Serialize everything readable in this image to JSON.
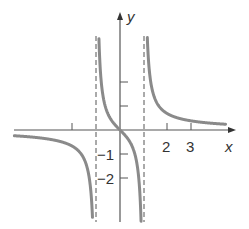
{
  "chart_data": {
    "type": "line",
    "title": "",
    "function": "y = x/(x^2 - 1)",
    "xlabel": "x",
    "ylabel": "y",
    "xlim": [
      -4.5,
      4.5
    ],
    "ylim": [
      -4.2,
      5.2
    ],
    "asymptotes_vertical": [
      -1,
      1
    ],
    "asymptote_horizontal": 0,
    "x_ticks": [
      -2,
      2,
      3
    ],
    "x_tick_labels": [
      "",
      "2",
      "3"
    ],
    "y_ticks": [
      -2,
      -1,
      1,
      2
    ],
    "y_tick_labels": [
      "−2",
      "−1",
      "",
      ""
    ],
    "grid": false,
    "series": [
      {
        "name": "left branch",
        "x": [
          -4.5,
          -3,
          -2,
          -1.5,
          -1.25,
          -1.1
        ],
        "y": [
          -0.23,
          -0.375,
          -0.67,
          -1.2,
          -2.22,
          -5.24
        ]
      },
      {
        "name": "middle branch",
        "x": [
          -0.8,
          -0.5,
          0,
          0.5,
          0.8
        ],
        "y": [
          2.22,
          0.67,
          0,
          -0.67,
          -2.22
        ]
      },
      {
        "name": "right branch",
        "x": [
          1.1,
          1.25,
          1.5,
          2,
          3,
          4.5
        ],
        "y": [
          5.24,
          2.22,
          1.2,
          0.67,
          0.375,
          0.23
        ]
      }
    ],
    "colors": {
      "curve": "#8a8a8a",
      "axes": "#555555",
      "asymptote": "#555555"
    }
  },
  "labels": {
    "x_axis": "x",
    "y_axis": "y",
    "tick_2": "2",
    "tick_3": "3",
    "tick_neg1": "−1",
    "tick_neg2": "−2"
  }
}
